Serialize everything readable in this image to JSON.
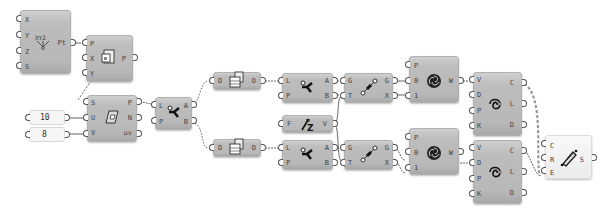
{
  "canvas": {
    "background": "#ffffff",
    "node_color": "#bcbcbc",
    "wire_color": "#555555"
  },
  "nodes": [
    {
      "id": "construct-point",
      "inputs": [
        "X",
        "Y",
        "Z",
        "S"
      ],
      "outputs": [
        "Pt"
      ],
      "icon": "xyz-point-icon"
    },
    {
      "id": "plane-origin",
      "inputs": [
        "P",
        "X",
        "Y"
      ],
      "outputs": [
        "P"
      ],
      "icon": "plane-icon"
    },
    {
      "id": "surface-divide",
      "inputs": [
        "S",
        "U",
        "V"
      ],
      "outputs": [
        "P",
        "N",
        "uv"
      ],
      "icon": "surface-grid-icon"
    },
    {
      "id": "list-item-1",
      "inputs": [
        "L",
        "P"
      ],
      "outputs": [
        "A",
        "B"
      ],
      "icon": "dispatch-icon"
    },
    {
      "id": "flatten-top",
      "inputs": [
        "D"
      ],
      "outputs": [
        "D"
      ],
      "icon": "flatten-tree-icon"
    },
    {
      "id": "flatten-bottom",
      "inputs": [
        "D"
      ],
      "outputs": [
        "D"
      ],
      "icon": "flatten-tree-icon"
    },
    {
      "id": "dispatch-top",
      "inputs": [
        "L",
        "P"
      ],
      "outputs": [
        "A",
        "B"
      ],
      "icon": "dispatch-icon"
    },
    {
      "id": "negate-vector",
      "inputs": [
        "F"
      ],
      "outputs": [
        "V"
      ],
      "icon": "vector-z-icon"
    },
    {
      "id": "dispatch-bottom",
      "inputs": [
        "L",
        "P"
      ],
      "outputs": [
        "A",
        "B"
      ],
      "icon": "dispatch-icon"
    },
    {
      "id": "move-top",
      "inputs": [
        "G",
        "T"
      ],
      "outputs": [
        "G",
        "X"
      ],
      "icon": "move-icon"
    },
    {
      "id": "move-bottom",
      "inputs": [
        "G",
        "T"
      ],
      "outputs": [
        "G",
        "X"
      ],
      "icon": "move-icon"
    },
    {
      "id": "weave-top",
      "inputs": [
        "P",
        "0",
        "1"
      ],
      "outputs": [
        "W"
      ],
      "icon": "weave-icon"
    },
    {
      "id": "weave-bottom",
      "inputs": [
        "P",
        "0",
        "1"
      ],
      "outputs": [
        "W"
      ],
      "icon": "weave-icon"
    },
    {
      "id": "curve-top",
      "inputs": [
        "V",
        "D",
        "P",
        "K"
      ],
      "outputs": [
        "C",
        "L",
        "D"
      ],
      "icon": "nurbs-curve-icon"
    },
    {
      "id": "curve-bottom",
      "inputs": [
        "V",
        "D",
        "P",
        "K"
      ],
      "outputs": [
        "C",
        "L",
        "D"
      ],
      "icon": "nurbs-curve-icon"
    },
    {
      "id": "sweep-loft",
      "inputs": [
        "C",
        "R",
        "E"
      ],
      "outputs": [
        "S"
      ],
      "icon": "loft-surface-icon"
    }
  ],
  "sliders": [
    {
      "id": "u-count",
      "value": "10"
    },
    {
      "id": "v-count",
      "value": "8"
    }
  ]
}
